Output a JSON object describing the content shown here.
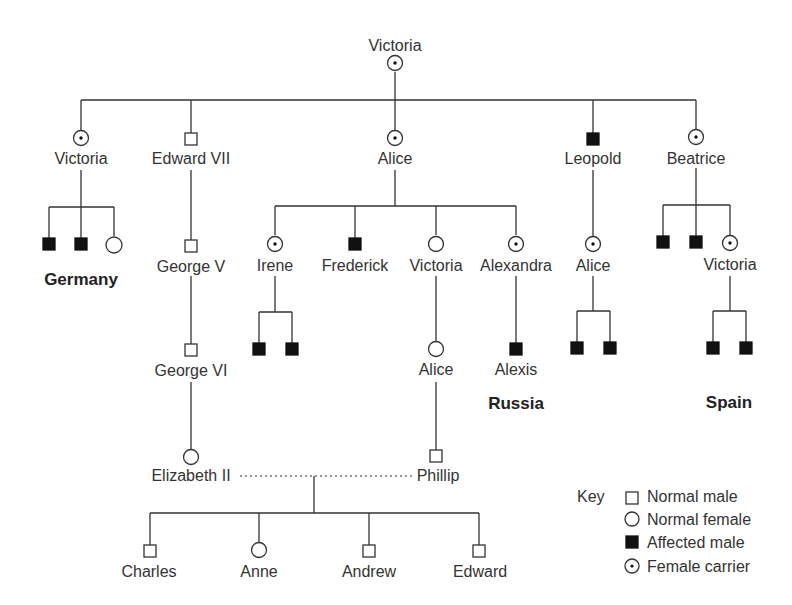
{
  "people": {
    "victoria_root": {
      "name": "Victoria",
      "type": "female-carrier"
    },
    "victoria_g1": {
      "name": "Victoria",
      "type": "female-carrier"
    },
    "edward_vii": {
      "name": "Edward VII",
      "type": "normal-male"
    },
    "alice_g1": {
      "name": "Alice",
      "type": "female-carrier"
    },
    "leopold": {
      "name": "Leopold",
      "type": "affected-male"
    },
    "beatrice": {
      "name": "Beatrice",
      "type": "female-carrier"
    },
    "george_v": {
      "name": "George V",
      "type": "normal-male"
    },
    "irene": {
      "name": "Irene",
      "type": "female-carrier"
    },
    "frederick": {
      "name": "Frederick",
      "type": "affected-male"
    },
    "victoria_g2": {
      "name": "Victoria",
      "type": "normal-female"
    },
    "alexandra": {
      "name": "Alexandra",
      "type": "female-carrier"
    },
    "alice_g2": {
      "name": "Alice",
      "type": "female-carrier"
    },
    "victoria_spain": {
      "name": "Victoria",
      "type": "female-carrier"
    },
    "george_vi": {
      "name": "George VI",
      "type": "normal-male"
    },
    "alice_g3": {
      "name": "Alice",
      "type": "normal-female"
    },
    "alexis": {
      "name": "Alexis",
      "type": "affected-male"
    },
    "elizabeth_ii": {
      "name": "Elizabeth II",
      "type": "normal-female"
    },
    "phillip": {
      "name": "Phillip",
      "type": "normal-male"
    },
    "charles": {
      "name": "Charles",
      "type": "normal-male"
    },
    "anne": {
      "name": "Anne",
      "type": "normal-female"
    },
    "andrew": {
      "name": "Andrew",
      "type": "normal-male"
    },
    "edward": {
      "name": "Edward",
      "type": "normal-male"
    }
  },
  "regions": {
    "germany": "Germany",
    "russia": "Russia",
    "spain": "Spain"
  },
  "key": {
    "title": "Key",
    "items": [
      {
        "symbol": "square-open",
        "label": "Normal male"
      },
      {
        "symbol": "circle-open",
        "label": "Normal female"
      },
      {
        "symbol": "square-filled",
        "label": "Affected male"
      },
      {
        "symbol": "circle-dot",
        "label": "Female carrier"
      }
    ]
  }
}
